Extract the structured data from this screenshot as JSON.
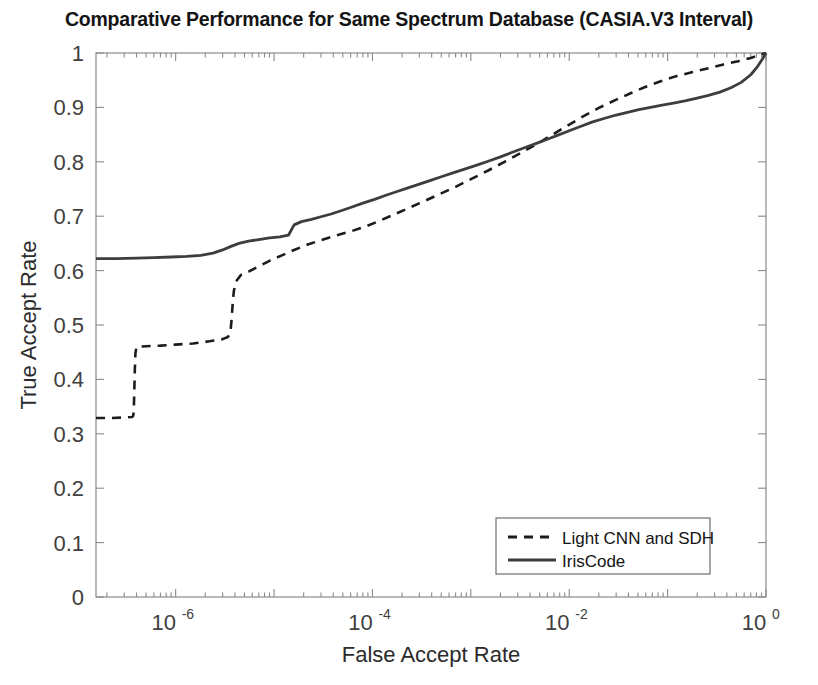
{
  "figure": {
    "title": "Comparative Performance for Same Spectrum Database (CASIA.V3 Interval)",
    "background_color": "#ffffff",
    "axis_color": "#7a7a7a",
    "text_color": "#2b2b2b"
  },
  "chart_data": {
    "type": "line",
    "title": "Comparative Performance for Same Spectrum Database (CASIA.V3 Interval)",
    "xlabel": "False Accept Rate",
    "ylabel": "True Accept Rate",
    "xscale": "log",
    "yscale": "linear",
    "xlim": [
      1.55e-07,
      1.0
    ],
    "ylim": [
      0,
      1
    ],
    "grid": false,
    "legend_position": "lower right",
    "x_tick_labels": [
      "10^-6",
      "10^-4",
      "10^-2",
      "10^0"
    ],
    "x_tick_values": [
      1e-06,
      0.0001,
      0.01,
      1
    ],
    "y_tick_labels": [
      "0",
      "0.1",
      "0.2",
      "0.3",
      "0.4",
      "0.5",
      "0.6",
      "0.7",
      "0.8",
      "0.9",
      "1"
    ],
    "y_tick_values": [
      0,
      0.1,
      0.2,
      0.3,
      0.4,
      0.5,
      0.6,
      0.7,
      0.8,
      0.9,
      1
    ],
    "series": [
      {
        "name": "Light CNN and SDH",
        "line_style": "dashed",
        "color": "#1c1c1c",
        "line_width": 2.6,
        "points": [
          [
            1.55e-07,
            0.329
          ],
          [
            2.2e-07,
            0.329
          ],
          [
            3e-07,
            0.33
          ],
          [
            3.6e-07,
            0.331
          ],
          [
            3.7e-07,
            0.333
          ],
          [
            3.75e-07,
            0.34
          ],
          [
            3.8e-07,
            0.38
          ],
          [
            3.85e-07,
            0.42
          ],
          [
            3.9e-07,
            0.448
          ],
          [
            4e-07,
            0.46
          ],
          [
            5e-07,
            0.461
          ],
          [
            7e-07,
            0.462
          ],
          [
            1e-06,
            0.464
          ],
          [
            1.5e-06,
            0.466
          ],
          [
            2.2e-06,
            0.47
          ],
          [
            3e-06,
            0.474
          ],
          [
            3.4e-06,
            0.478
          ],
          [
            3.6e-06,
            0.486
          ],
          [
            3.7e-06,
            0.51
          ],
          [
            3.8e-06,
            0.54
          ],
          [
            3.9e-06,
            0.562
          ],
          [
            4.1e-06,
            0.58
          ],
          [
            4.6e-06,
            0.592
          ],
          [
            5.5e-06,
            0.598
          ],
          [
            7e-06,
            0.608
          ],
          [
            9e-06,
            0.618
          ],
          [
            1.2e-05,
            0.628
          ],
          [
            1.6e-05,
            0.638
          ],
          [
            2.2e-05,
            0.648
          ],
          [
            3e-05,
            0.656
          ],
          [
            4.2e-05,
            0.664
          ],
          [
            6e-05,
            0.672
          ],
          [
            8.5e-05,
            0.681
          ],
          [
            0.00012,
            0.692
          ],
          [
            0.00017,
            0.704
          ],
          [
            0.00024,
            0.716
          ],
          [
            0.00034,
            0.728
          ],
          [
            0.0005,
            0.742
          ],
          [
            0.0007,
            0.754
          ],
          [
            0.001,
            0.768
          ],
          [
            0.0015,
            0.784
          ],
          [
            0.0022,
            0.8
          ],
          [
            0.0032,
            0.816
          ],
          [
            0.0046,
            0.832
          ],
          [
            0.0065,
            0.848
          ],
          [
            0.0095,
            0.866
          ],
          [
            0.014,
            0.884
          ],
          [
            0.02,
            0.899
          ],
          [
            0.029,
            0.913
          ],
          [
            0.042,
            0.926
          ],
          [
            0.06,
            0.938
          ],
          [
            0.085,
            0.948
          ],
          [
            0.12,
            0.957
          ],
          [
            0.18,
            0.965
          ],
          [
            0.26,
            0.972
          ],
          [
            0.37,
            0.979
          ],
          [
            0.52,
            0.985
          ],
          [
            0.7,
            0.991
          ],
          [
            0.85,
            0.996
          ],
          [
            1.0,
            1.0
          ]
        ]
      },
      {
        "name": "IrisCode",
        "line_style": "solid",
        "color": "#3d3d3d",
        "line_width": 2.8,
        "points": [
          [
            1.55e-07,
            0.622
          ],
          [
            2.5e-07,
            0.622
          ],
          [
            4e-07,
            0.623
          ],
          [
            6e-07,
            0.624
          ],
          [
            9e-07,
            0.625
          ],
          [
            1.3e-06,
            0.626
          ],
          [
            1.8e-06,
            0.628
          ],
          [
            2.4e-06,
            0.632
          ],
          [
            3e-06,
            0.638
          ],
          [
            3.6e-06,
            0.644
          ],
          [
            4.4e-06,
            0.65
          ],
          [
            5.5e-06,
            0.654
          ],
          [
            7e-06,
            0.657
          ],
          [
            9e-06,
            0.66
          ],
          [
            1.15e-05,
            0.662
          ],
          [
            1.4e-05,
            0.665
          ],
          [
            1.6e-05,
            0.684
          ],
          [
            1.9e-05,
            0.69
          ],
          [
            2.4e-05,
            0.694
          ],
          [
            3e-05,
            0.699
          ],
          [
            3.8e-05,
            0.704
          ],
          [
            4.8e-05,
            0.71
          ],
          [
            6.2e-05,
            0.717
          ],
          [
            8e-05,
            0.724
          ],
          [
            0.000105,
            0.731
          ],
          [
            0.000135,
            0.738
          ],
          [
            0.000175,
            0.745
          ],
          [
            0.00023,
            0.752
          ],
          [
            0.0003,
            0.759
          ],
          [
            0.00039,
            0.766
          ],
          [
            0.00051,
            0.773
          ],
          [
            0.00067,
            0.78
          ],
          [
            0.00088,
            0.787
          ],
          [
            0.00115,
            0.794
          ],
          [
            0.0015,
            0.801
          ],
          [
            0.002,
            0.809
          ],
          [
            0.0026,
            0.817
          ],
          [
            0.0034,
            0.825
          ],
          [
            0.0045,
            0.833
          ],
          [
            0.0059,
            0.841
          ],
          [
            0.0077,
            0.849
          ],
          [
            0.01,
            0.857
          ],
          [
            0.013,
            0.865
          ],
          [
            0.017,
            0.873
          ],
          [
            0.023,
            0.88
          ],
          [
            0.03,
            0.886
          ],
          [
            0.039,
            0.891
          ],
          [
            0.051,
            0.896
          ],
          [
            0.067,
            0.9
          ],
          [
            0.088,
            0.904
          ],
          [
            0.115,
            0.908
          ],
          [
            0.15,
            0.912
          ],
          [
            0.2,
            0.917
          ],
          [
            0.26,
            0.922
          ],
          [
            0.34,
            0.928
          ],
          [
            0.44,
            0.936
          ],
          [
            0.56,
            0.946
          ],
          [
            0.7,
            0.96
          ],
          [
            0.82,
            0.975
          ],
          [
            0.92,
            0.989
          ],
          [
            1.0,
            1.0
          ]
        ]
      }
    ]
  },
  "legend": {
    "entries": [
      {
        "label": "Light CNN and SDH",
        "style": "dashed"
      },
      {
        "label": "IrisCode",
        "style": "solid"
      }
    ]
  }
}
